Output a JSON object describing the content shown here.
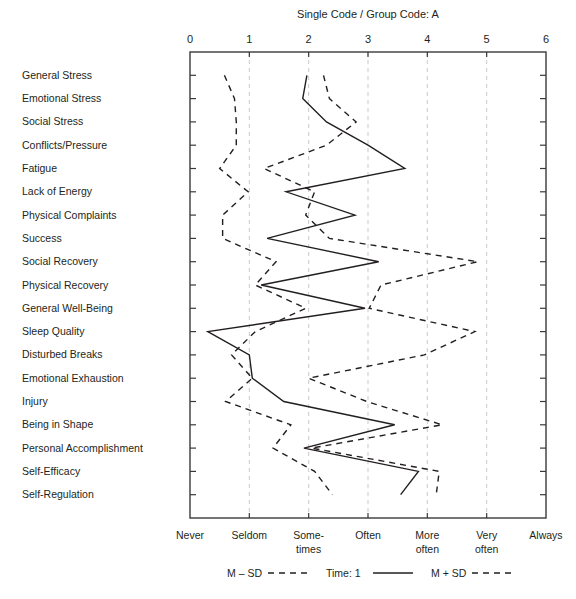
{
  "chart_data": {
    "type": "line",
    "title": "Single Code / Group Code: A",
    "xlabel": "",
    "ylabel": "",
    "xlim": [
      0,
      6
    ],
    "orientation": "horizontal",
    "grid": true,
    "legend_position": "bottom",
    "x_ticks": [
      "0",
      "1",
      "2",
      "3",
      "4",
      "5",
      "6"
    ],
    "x_tick_values": [
      0,
      1,
      2,
      3,
      4,
      5,
      6
    ],
    "x_scale_labels": [
      {
        "value": 0,
        "line1": "Never",
        "line2": ""
      },
      {
        "value": 1,
        "line1": "Seldom",
        "line2": ""
      },
      {
        "value": 2,
        "line1": "Some-",
        "line2": "times"
      },
      {
        "value": 3,
        "line1": "Often",
        "line2": ""
      },
      {
        "value": 4,
        "line1": "More",
        "line2": "often"
      },
      {
        "value": 5,
        "line1": "Very",
        "line2": "often"
      },
      {
        "value": 6,
        "line1": "Always",
        "line2": ""
      }
    ],
    "categories": [
      "General Stress",
      "Emotional Stress",
      "Social Stress",
      "Conflicts/Pressure",
      "Fatigue",
      "Lack of Energy",
      "Physical Complaints",
      "Success",
      "Social Recovery",
      "Physical Recovery",
      "General Well-Being",
      "Sleep Quality",
      "Disturbed Breaks",
      "Emotional Exhaustion",
      "Injury",
      "Being in Shape",
      "Personal Accomplishment",
      "Self-Efficacy",
      "Self-Regulation"
    ],
    "series": [
      {
        "name": "M – SD",
        "style": "dashed",
        "values": [
          0.58,
          0.75,
          0.78,
          0.78,
          0.5,
          0.98,
          0.55,
          0.55,
          1.45,
          1.1,
          1.95,
          1.1,
          0.7,
          1.05,
          0.6,
          1.7,
          1.4,
          2.1,
          2.4
        ]
      },
      {
        "name": "Time: 1",
        "style": "solid",
        "values": [
          1.97,
          1.9,
          2.3,
          3.0,
          3.62,
          1.62,
          2.78,
          1.3,
          3.18,
          1.2,
          2.95,
          0.3,
          1.0,
          1.05,
          1.58,
          3.45,
          1.92,
          3.85,
          3.55
        ]
      },
      {
        "name": "M + SD",
        "style": "dashed",
        "values": [
          2.25,
          2.35,
          2.8,
          2.3,
          1.25,
          2.1,
          1.95,
          2.35,
          4.85,
          3.22,
          3.02,
          4.8,
          3.95,
          2.0,
          2.98,
          4.25,
          2.05,
          4.2,
          4.15
        ]
      }
    ],
    "legend": [
      {
        "label": "M – SD",
        "style": "dashed"
      },
      {
        "label": "Time: 1",
        "style": "solid"
      },
      {
        "label": "M + SD",
        "style": "dashed"
      }
    ]
  }
}
